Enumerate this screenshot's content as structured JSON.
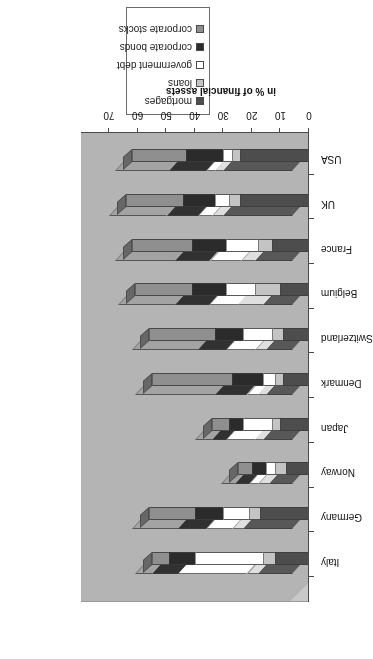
{
  "chart": {
    "ylabel": "in % of financial assets",
    "y_ticks": [
      "0",
      "10",
      "20",
      "30",
      "40",
      "50",
      "60",
      "70"
    ],
    "legend": {
      "items": [
        {
          "label": "mortgages",
          "color": "#4d4d4d"
        },
        {
          "label": "loans",
          "color": "#c4c4c4"
        },
        {
          "label": "government debt",
          "color": "#ffffff"
        },
        {
          "label": "corporate bonds",
          "color": "#2b2b2b"
        },
        {
          "label": "corporate stocks",
          "color": "#8f8f8f"
        }
      ]
    }
  },
  "chart_data": {
    "type": "bar",
    "subtype": "stacked-3d-column",
    "title": "",
    "xlabel": "",
    "ylabel": "in % of financial assets",
    "ylim": [
      0,
      70
    ],
    "grid": false,
    "legend_position": "top-right",
    "orientation": "image-rotated-180",
    "categories": [
      "USA",
      "UK",
      "France",
      "Belgium",
      "Switzerland",
      "Denmark",
      "Japan",
      "Norway",
      "Germany",
      "Italy"
    ],
    "series": [
      {
        "name": "mortgages",
        "color": "#4d4d4d",
        "values": [
          24,
          24,
          13,
          10,
          9,
          9,
          10,
          8,
          17,
          12
        ]
      },
      {
        "name": "loans",
        "color": "#c4c4c4",
        "values": [
          3,
          4,
          5,
          9,
          4,
          3,
          3,
          4,
          4,
          4
        ]
      },
      {
        "name": "government debt",
        "color": "#ffffff",
        "values": [
          3,
          5,
          11,
          10,
          10,
          4,
          10,
          3,
          9,
          24
        ]
      },
      {
        "name": "corporate bonds",
        "color": "#2b2b2b",
        "values": [
          13,
          11,
          12,
          12,
          10,
          11,
          5,
          5,
          10,
          9
        ]
      },
      {
        "name": "corporate stocks",
        "color": "#8f8f8f",
        "values": [
          19,
          20,
          21,
          20,
          23,
          28,
          6,
          5,
          16,
          6
        ]
      }
    ],
    "totals": [
      62,
      64,
      62,
      61,
      56,
      55,
      34,
      25,
      56,
      55
    ]
  }
}
